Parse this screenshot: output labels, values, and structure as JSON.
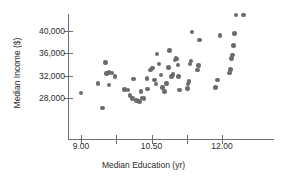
{
  "chart_data": {
    "type": "scatter",
    "title": "",
    "xlabel": "Median Education (yr)",
    "ylabel": "Median Income ($)",
    "xlim": [
      8.55,
      12.95
    ],
    "ylim": [
      25600,
      43600
    ],
    "grid": false,
    "legend": null,
    "marker_color": "#6b6b6b",
    "axis_color": "#6e6e6e",
    "x_ticks": [
      9.0,
      9.75,
      10.5,
      11.25,
      12.0
    ],
    "x_tick_labels": [
      "9.00",
      "",
      "10.50",
      "",
      "12.00"
    ],
    "y_ticks": [
      28000,
      32000,
      36000,
      40000
    ],
    "y_tick_labels": [
      "28,000",
      "32,000",
      "36,000",
      "40,000"
    ],
    "n_points": 60,
    "points": [
      {
        "x": 9.0,
        "y": 28900
      },
      {
        "x": 9.46,
        "y": 26200
      },
      {
        "x": 9.36,
        "y": 30600
      },
      {
        "x": 9.52,
        "y": 34400
      },
      {
        "x": 9.54,
        "y": 32400
      },
      {
        "x": 9.6,
        "y": 32600
      },
      {
        "x": 9.66,
        "y": 32500
      },
      {
        "x": 9.72,
        "y": 31900
      },
      {
        "x": 9.6,
        "y": 30300
      },
      {
        "x": 9.92,
        "y": 29500
      },
      {
        "x": 10.0,
        "y": 29400
      },
      {
        "x": 10.04,
        "y": 28500
      },
      {
        "x": 10.1,
        "y": 27900
      },
      {
        "x": 10.12,
        "y": 31400
      },
      {
        "x": 10.18,
        "y": 27600
      },
      {
        "x": 10.24,
        "y": 27400
      },
      {
        "x": 10.3,
        "y": 28000
      },
      {
        "x": 10.34,
        "y": 27900
      },
      {
        "x": 10.28,
        "y": 29200
      },
      {
        "x": 10.42,
        "y": 29600
      },
      {
        "x": 10.4,
        "y": 31500
      },
      {
        "x": 10.48,
        "y": 33000
      },
      {
        "x": 10.52,
        "y": 33400
      },
      {
        "x": 10.56,
        "y": 31200
      },
      {
        "x": 10.6,
        "y": 30500
      },
      {
        "x": 10.62,
        "y": 35900
      },
      {
        "x": 10.66,
        "y": 34100
      },
      {
        "x": 10.7,
        "y": 32100
      },
      {
        "x": 10.74,
        "y": 29900
      },
      {
        "x": 10.78,
        "y": 29200
      },
      {
        "x": 10.82,
        "y": 30600
      },
      {
        "x": 10.86,
        "y": 33500
      },
      {
        "x": 10.88,
        "y": 36500
      },
      {
        "x": 10.92,
        "y": 31900
      },
      {
        "x": 10.96,
        "y": 32200
      },
      {
        "x": 11.0,
        "y": 34800
      },
      {
        "x": 11.02,
        "y": 35200
      },
      {
        "x": 11.04,
        "y": 35000
      },
      {
        "x": 11.06,
        "y": 33900
      },
      {
        "x": 11.08,
        "y": 31800
      },
      {
        "x": 11.1,
        "y": 29400
      },
      {
        "x": 11.26,
        "y": 29700
      },
      {
        "x": 11.28,
        "y": 30500
      },
      {
        "x": 11.3,
        "y": 31000
      },
      {
        "x": 11.32,
        "y": 34100
      },
      {
        "x": 11.34,
        "y": 34600
      },
      {
        "x": 11.36,
        "y": 39800
      },
      {
        "x": 11.48,
        "y": 33000
      },
      {
        "x": 11.5,
        "y": 33800
      },
      {
        "x": 11.52,
        "y": 38400
      },
      {
        "x": 11.86,
        "y": 29900
      },
      {
        "x": 11.9,
        "y": 31200
      },
      {
        "x": 11.96,
        "y": 39200
      },
      {
        "x": 12.16,
        "y": 32500
      },
      {
        "x": 12.18,
        "y": 33100
      },
      {
        "x": 12.2,
        "y": 35100
      },
      {
        "x": 12.22,
        "y": 35700
      },
      {
        "x": 12.24,
        "y": 37400
      },
      {
        "x": 12.26,
        "y": 39500
      },
      {
        "x": 12.3,
        "y": 42900
      },
      {
        "x": 12.46,
        "y": 42900
      }
    ]
  }
}
